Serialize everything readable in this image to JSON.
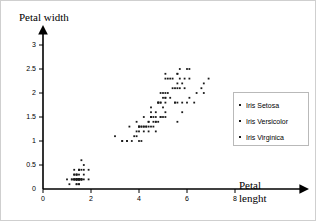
{
  "chart_data": {
    "type": "scatter",
    "title": "",
    "xlabel": "Petal lenght",
    "ylabel": "Petal width",
    "xlim": [
      0,
      8.6
    ],
    "ylim": [
      0,
      3.15
    ],
    "xticks": [
      "0",
      "2",
      "4",
      "6",
      "8"
    ],
    "xtick_values": [
      0,
      2,
      4,
      6,
      8
    ],
    "yticks": [
      "0",
      "0.5",
      "1",
      "1.5",
      "2",
      "2.5",
      "3"
    ],
    "ytick_values": [
      0,
      0.5,
      1,
      1.5,
      2,
      2.5,
      3
    ],
    "grid": false,
    "legend_position": "right",
    "marker_color": "#1a1a1a",
    "axis_color": "#000000",
    "series": [
      {
        "name": "Iris Setosa",
        "color": "#1a1a1a",
        "points": [
          [
            1.4,
            0.2
          ],
          [
            1.4,
            0.2
          ],
          [
            1.3,
            0.2
          ],
          [
            1.5,
            0.2
          ],
          [
            1.4,
            0.2
          ],
          [
            1.7,
            0.4
          ],
          [
            1.4,
            0.3
          ],
          [
            1.5,
            0.2
          ],
          [
            1.4,
            0.2
          ],
          [
            1.5,
            0.1
          ],
          [
            1.5,
            0.2
          ],
          [
            1.6,
            0.2
          ],
          [
            1.4,
            0.1
          ],
          [
            1.1,
            0.1
          ],
          [
            1.2,
            0.2
          ],
          [
            1.5,
            0.4
          ],
          [
            1.3,
            0.4
          ],
          [
            1.4,
            0.3
          ],
          [
            1.7,
            0.3
          ],
          [
            1.5,
            0.3
          ],
          [
            1.7,
            0.2
          ],
          [
            1.5,
            0.4
          ],
          [
            1.0,
            0.2
          ],
          [
            1.7,
            0.5
          ],
          [
            1.9,
            0.2
          ],
          [
            1.6,
            0.2
          ],
          [
            1.6,
            0.4
          ],
          [
            1.5,
            0.2
          ],
          [
            1.4,
            0.2
          ],
          [
            1.6,
            0.2
          ],
          [
            1.6,
            0.2
          ],
          [
            1.5,
            0.4
          ],
          [
            1.5,
            0.1
          ],
          [
            1.4,
            0.2
          ],
          [
            1.5,
            0.2
          ],
          [
            1.2,
            0.2
          ],
          [
            1.3,
            0.2
          ],
          [
            1.4,
            0.1
          ],
          [
            1.3,
            0.2
          ],
          [
            1.5,
            0.2
          ],
          [
            1.3,
            0.3
          ],
          [
            1.3,
            0.3
          ],
          [
            1.3,
            0.2
          ],
          [
            1.6,
            0.6
          ],
          [
            1.9,
            0.4
          ],
          [
            1.4,
            0.3
          ],
          [
            1.6,
            0.2
          ],
          [
            1.4,
            0.2
          ],
          [
            1.5,
            0.2
          ],
          [
            1.4,
            0.2
          ]
        ]
      },
      {
        "name": "Iris Versicolor",
        "color": "#1a1a1a",
        "points": [
          [
            4.7,
            1.4
          ],
          [
            4.5,
            1.5
          ],
          [
            4.9,
            1.5
          ],
          [
            4.0,
            1.3
          ],
          [
            4.6,
            1.5
          ],
          [
            4.5,
            1.3
          ],
          [
            4.7,
            1.6
          ],
          [
            3.3,
            1.0
          ],
          [
            4.6,
            1.3
          ],
          [
            3.9,
            1.4
          ],
          [
            3.5,
            1.0
          ],
          [
            4.2,
            1.5
          ],
          [
            4.0,
            1.0
          ],
          [
            4.7,
            1.4
          ],
          [
            3.6,
            1.3
          ],
          [
            4.4,
            1.4
          ],
          [
            4.5,
            1.5
          ],
          [
            4.1,
            1.0
          ],
          [
            4.5,
            1.5
          ],
          [
            3.9,
            1.1
          ],
          [
            4.8,
            1.8
          ],
          [
            4.0,
            1.3
          ],
          [
            4.9,
            1.5
          ],
          [
            4.7,
            1.2
          ],
          [
            4.3,
            1.3
          ],
          [
            4.4,
            1.4
          ],
          [
            4.8,
            1.4
          ],
          [
            5.0,
            1.7
          ],
          [
            4.5,
            1.5
          ],
          [
            3.5,
            1.0
          ],
          [
            3.8,
            1.1
          ],
          [
            3.7,
            1.0
          ],
          [
            3.9,
            1.2
          ],
          [
            5.1,
            1.6
          ],
          [
            4.5,
            1.5
          ],
          [
            4.5,
            1.6
          ],
          [
            4.7,
            1.5
          ],
          [
            4.4,
            1.3
          ],
          [
            4.1,
            1.3
          ],
          [
            4.0,
            1.3
          ],
          [
            4.4,
            1.2
          ],
          [
            4.6,
            1.4
          ],
          [
            4.0,
            1.2
          ],
          [
            3.3,
            1.0
          ],
          [
            4.2,
            1.3
          ],
          [
            4.2,
            1.2
          ],
          [
            4.2,
            1.3
          ],
          [
            4.3,
            1.3
          ],
          [
            3.0,
            1.1
          ],
          [
            4.1,
            1.3
          ]
        ]
      },
      {
        "name": "Iris Virginica",
        "color": "#1a1a1a",
        "points": [
          [
            6.0,
            2.5
          ],
          [
            5.1,
            1.9
          ],
          [
            5.9,
            2.1
          ],
          [
            5.6,
            1.8
          ],
          [
            5.8,
            2.2
          ],
          [
            6.6,
            2.1
          ],
          [
            4.5,
            1.7
          ],
          [
            6.3,
            1.8
          ],
          [
            5.8,
            1.8
          ],
          [
            6.1,
            2.5
          ],
          [
            5.1,
            2.0
          ],
          [
            5.3,
            1.9
          ],
          [
            5.5,
            2.1
          ],
          [
            5.0,
            2.0
          ],
          [
            5.1,
            2.4
          ],
          [
            5.3,
            2.3
          ],
          [
            5.5,
            1.8
          ],
          [
            6.7,
            2.2
          ],
          [
            6.9,
            2.3
          ],
          [
            5.0,
            1.5
          ],
          [
            5.7,
            2.3
          ],
          [
            4.9,
            2.0
          ],
          [
            6.7,
            2.0
          ],
          [
            4.9,
            1.8
          ],
          [
            5.7,
            2.1
          ],
          [
            6.0,
            1.8
          ],
          [
            4.8,
            1.8
          ],
          [
            4.9,
            1.8
          ],
          [
            5.6,
            2.1
          ],
          [
            5.8,
            1.6
          ],
          [
            6.1,
            1.9
          ],
          [
            6.4,
            2.0
          ],
          [
            5.6,
            2.2
          ],
          [
            5.1,
            1.5
          ],
          [
            5.6,
            1.4
          ],
          [
            6.1,
            2.3
          ],
          [
            5.6,
            2.4
          ],
          [
            5.5,
            1.8
          ],
          [
            4.8,
            1.8
          ],
          [
            5.4,
            2.1
          ],
          [
            5.6,
            2.4
          ],
          [
            5.1,
            2.3
          ],
          [
            5.1,
            1.9
          ],
          [
            5.9,
            2.3
          ],
          [
            5.7,
            2.5
          ],
          [
            5.2,
            2.3
          ],
          [
            5.0,
            1.9
          ],
          [
            5.2,
            2.0
          ],
          [
            5.4,
            2.3
          ],
          [
            5.1,
            1.8
          ]
        ]
      }
    ]
  },
  "legend": {
    "items": [
      {
        "label": "Iris Setosa"
      },
      {
        "label": "Iris Versicolor"
      },
      {
        "label": "Iris Virginica"
      }
    ]
  },
  "axis_titles": {
    "y": "Petal width",
    "x_line1": "Petal",
    "x_line2": "lenght"
  }
}
